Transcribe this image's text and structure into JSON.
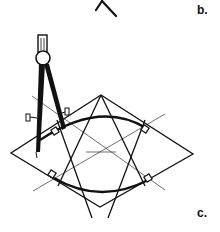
{
  "figure": {
    "labels": {
      "b": "b.",
      "c": "c."
    },
    "colors": {
      "ink": "#111111",
      "background": "#ffffff"
    },
    "parts": [
      "partial-view-b-tip",
      "compass",
      "rhombus",
      "star-lines",
      "upper-arc",
      "lower-arc",
      "right-angle-markers",
      "thin-construction-lines"
    ]
  }
}
